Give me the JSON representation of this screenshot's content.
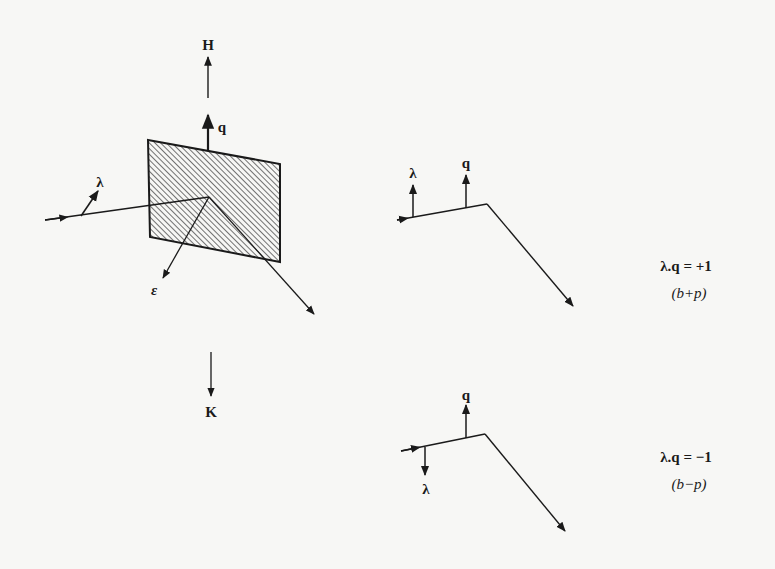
{
  "figure": {
    "left_diagram": {
      "labels": {
        "H": "H",
        "q": "q",
        "lambda": "λ",
        "epsilon": "ε",
        "K": "K"
      },
      "plane_fill": "hatched",
      "colors": {
        "ink": "#1a1a1a",
        "paper": "#f7f7f5"
      }
    },
    "top_right_diagram": {
      "labels": {
        "lambda": "λ",
        "q": "q"
      },
      "equation": "λ.q = +1",
      "case": "(b+p)"
    },
    "bottom_right_diagram": {
      "labels": {
        "lambda": "λ",
        "q": "q"
      },
      "equation": "λ.q = −1",
      "case": "(b−p)"
    }
  }
}
